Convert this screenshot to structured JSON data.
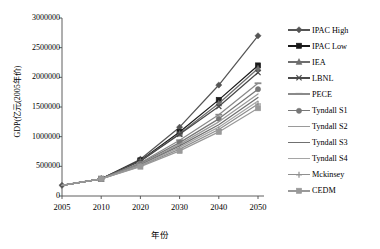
{
  "chart_data": {
    "type": "line",
    "title": "",
    "xlabel": "年份",
    "ylabel": "GDP(亿元(2005年价)",
    "categories": [
      "2005",
      "2010",
      "2020",
      "2030",
      "2040",
      "2050"
    ],
    "ylim": [
      0,
      3000000
    ],
    "ytick_values": [
      0,
      500000,
      1000000,
      1500000,
      2000000,
      2500000,
      3000000
    ],
    "ytick_labels": [
      "0",
      "500000",
      "1000000",
      "1500000",
      "2000000",
      "2500000",
      "3000000"
    ],
    "grid": false,
    "legend_position": "right",
    "series": [
      {
        "name": "IPAC High",
        "color": "#555555",
        "marker": "diamond",
        "values": [
          180000,
          290000,
          620000,
          1160000,
          1870000,
          2700000
        ]
      },
      {
        "name": "IPAC Low",
        "color": "#1a1a1a",
        "marker": "square",
        "values": [
          180000,
          290000,
          600000,
          1080000,
          1620000,
          2200000
        ]
      },
      {
        "name": "IEA",
        "color": "#6e6e6e",
        "marker": "triangle",
        "values": [
          180000,
          290000,
          590000,
          1050000,
          1560000,
          2150000
        ]
      },
      {
        "name": "LBNL",
        "color": "#4a4a4a",
        "marker": "cross",
        "values": [
          180000,
          290000,
          585000,
          1040000,
          1510000,
          2080000
        ]
      },
      {
        "name": "PECE",
        "color": "#8a8a8a",
        "marker": "dash",
        "values": [
          180000,
          290000,
          560000,
          940000,
          1370000,
          1900000
        ]
      },
      {
        "name": "Tyndall S1",
        "color": "#777777",
        "marker": "circle",
        "values": [
          180000,
          290000,
          545000,
          900000,
          1300000,
          1800000
        ]
      },
      {
        "name": "Tyndall S2",
        "color": "#9a9a9a",
        "marker": "line-thin",
        "values": [
          180000,
          290000,
          535000,
          870000,
          1250000,
          1720000
        ]
      },
      {
        "name": "Tyndall S3",
        "color": "#707070",
        "marker": "none",
        "values": [
          180000,
          290000,
          525000,
          845000,
          1200000,
          1660000
        ]
      },
      {
        "name": "Tyndall S4",
        "color": "#a5a5a5",
        "marker": "none",
        "values": [
          180000,
          290000,
          515000,
          820000,
          1160000,
          1600000
        ]
      },
      {
        "name": "Mckinsey",
        "color": "#8f8f8f",
        "marker": "plus",
        "values": [
          180000,
          290000,
          505000,
          790000,
          1120000,
          1550000
        ]
      },
      {
        "name": "CEDM",
        "color": "#999999",
        "marker": "square",
        "values": [
          180000,
          290000,
          495000,
          760000,
          1080000,
          1480000
        ]
      }
    ]
  },
  "legend": {
    "items": [
      {
        "label": "IPAC High"
      },
      {
        "label": "IPAC Low"
      },
      {
        "label": "IEA"
      },
      {
        "label": "LBNL"
      },
      {
        "label": "PECE"
      },
      {
        "label": "Tyndall S1"
      },
      {
        "label": "Tyndall S2"
      },
      {
        "label": "Tyndall S3"
      },
      {
        "label": "Tyndall S4"
      },
      {
        "label": "Mckinsey"
      },
      {
        "label": "CEDM"
      }
    ]
  }
}
